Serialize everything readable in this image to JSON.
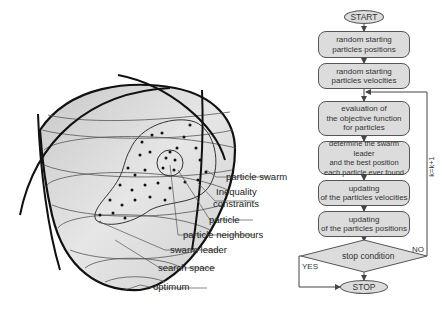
{
  "left_diagram": {
    "title": "PSO search space illustration",
    "labels": [
      {
        "id": "particle-swarm",
        "text": "particle swarm"
      },
      {
        "id": "inequality-constraints-1",
        "text": "Inequality"
      },
      {
        "id": "inequality-constraints-2",
        "text": "constraints"
      },
      {
        "id": "particle",
        "text": "particle"
      },
      {
        "id": "particle-neighbours",
        "text": "particle neighbours"
      },
      {
        "id": "swarm-leader",
        "text": "swarm leader"
      },
      {
        "id": "search-space",
        "text": "search space"
      },
      {
        "id": "optimum",
        "text": "optimum"
      }
    ]
  },
  "flowchart": {
    "start": "START",
    "stop": "STOP",
    "steps": [
      {
        "lines": [
          "random starting",
          "particles positions"
        ]
      },
      {
        "lines": [
          "random starting",
          "particles velocities"
        ]
      },
      {
        "lines": [
          "evaluation of",
          "the objective function",
          "for particles"
        ]
      },
      {
        "lines": [
          "determine the swarm leader",
          "and the best position",
          "each particle ever found"
        ]
      },
      {
        "lines": [
          "updating",
          "of the particles velocities"
        ]
      },
      {
        "lines": [
          "updating",
          "of the particles positions"
        ]
      }
    ],
    "decision": "stop condition",
    "yes_label": "YES",
    "no_label": "NO",
    "loop_label": "k=k+1"
  },
  "colors": {
    "fill": "#dcdcdc",
    "stroke": "#555555",
    "bowl_fill": "#d4d4d4",
    "dark_line": "#111111"
  }
}
